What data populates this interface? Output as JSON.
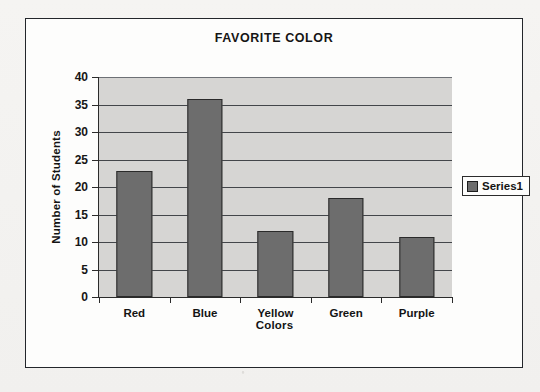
{
  "chart_data": {
    "type": "bar",
    "title": "FAVORITE COLOR",
    "xlabel": "Colors",
    "ylabel": "Number of Students",
    "categories": [
      "Red",
      "Blue",
      "Yellow",
      "Green",
      "Purple"
    ],
    "values": [
      23,
      36,
      12,
      18,
      11
    ],
    "series": [
      {
        "name": "Series1",
        "values": [
          23,
          36,
          12,
          18,
          11
        ]
      }
    ],
    "ylim": [
      0,
      40
    ],
    "ytick_step": 5,
    "yticks": [
      0,
      5,
      10,
      15,
      20,
      25,
      30,
      35,
      40
    ],
    "ytick_labels": [
      "0",
      "5",
      "10",
      "15",
      "20",
      "25",
      "30",
      "35",
      "40"
    ],
    "grid": true,
    "grid_axis": "y",
    "legend": {
      "position": "right",
      "entries": [
        "Series1"
      ]
    },
    "colors": {
      "bar_fill": "#6d6d6d",
      "bar_border": "#2a2a2a",
      "plot_background": "#d6d5d3",
      "gridline": "#43464a",
      "axis": "#2b2b2b",
      "text": "#141414",
      "chart_background": "#fdfdfc",
      "frame_border": "#23262b",
      "page_background": "#f4f3f1"
    }
  }
}
